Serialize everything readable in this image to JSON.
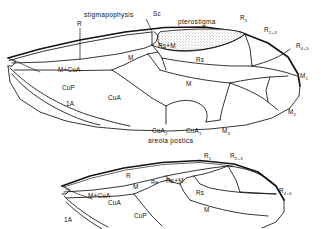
{
  "figure": {
    "background_color": "#ffffff",
    "ink_color": "#15120f",
    "stipple_color": "#8d8880"
  },
  "forewing": {
    "name": "forewing",
    "labels": {
      "stigmapophysis": "stigmapophysis",
      "sc": "Sc",
      "pterostigma": "pterostigma",
      "r": "R",
      "r1": "R",
      "r1_sub": "1",
      "r23": "R",
      "r23_sub": "2+3",
      "r45": "R",
      "r45_sub": "4+5",
      "rs_m": "Rs+M",
      "rs": "Rs",
      "m_plus_cua": "M+CuA",
      "m_left": "M",
      "m_mid": "M",
      "cup": "CuP",
      "cua": "CuA",
      "one_a": "1A",
      "cua2": "CuA",
      "cua2_sub": "2",
      "cua1": "CuA",
      "cua1_sub": "1",
      "m1": "M",
      "m1_sub": "1",
      "m2": "M",
      "m2_sub": "2",
      "m3": "M",
      "m3_sub": "3",
      "areola_postica": "areola postica"
    }
  },
  "hindwing": {
    "name": "hindwing",
    "labels": {
      "r": "R",
      "r1": "R",
      "r1_sub": "1",
      "r23": "R",
      "r23_sub": "2+3",
      "r45": "R",
      "r45_sub": "4+5",
      "rs_cell": "Rs",
      "rs_m": "Rs+M",
      "rs": "Rs",
      "m_plus_cua": "M+CuA",
      "m_left": "M",
      "m_mid": "M",
      "cua": "CuA",
      "cup": "CuP",
      "one_a": "1A"
    }
  }
}
